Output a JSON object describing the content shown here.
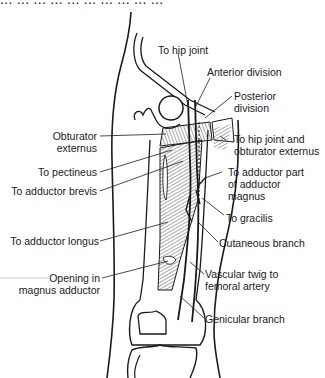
{
  "figure": {
    "cropped_header_text": "... ... ... ... ... ... ... ... ... ...",
    "colors": {
      "line": "#1a1a1a",
      "hatch": "#555555",
      "faint_rule": "#bdbdbd",
      "background": "#ffffff"
    }
  },
  "labels": {
    "to_hip_joint": "To hip joint",
    "anterior_division": "Anterior division",
    "posterior_division_1": "Posterior",
    "posterior_division_2": "division",
    "obturator_externus_1": "Obturator",
    "obturator_externus_2": "externus",
    "to_hip_joint_and_obt_1": "To hip joint and",
    "to_hip_joint_and_obt_2": "obturator externus",
    "to_pectineus": "To pectineus",
    "to_adductor_brevis": "To adductor brevis",
    "to_adductor_part_1": "To adductor part",
    "to_adductor_part_2": "of adductor",
    "to_adductor_part_3": "magnus",
    "to_gracilis": "To gracilis",
    "cutaneous_branch": "Cutaneous branch",
    "to_adductor_longus": "To adductor longus",
    "opening_1": "Opening in",
    "opening_2": "magnus adductor",
    "vascular_twig_1": "Vascular twig to",
    "vascular_twig_2": "femoral artery",
    "genicular_branch": "Genicular branch"
  }
}
